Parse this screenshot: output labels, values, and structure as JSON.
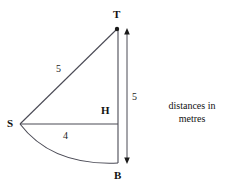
{
  "figure": {
    "type": "geometry-diagram",
    "caption_line1": "distances in",
    "caption_line2": "metres",
    "vertices": {
      "T": "T",
      "S": "S",
      "H": "H",
      "B": "B"
    },
    "measurements": {
      "slant_ST": "5",
      "horizontal_SH": "4",
      "vertical_TB": "5"
    },
    "colors": {
      "stroke": "#4a4a55",
      "text": "#111111",
      "background": "#ffffff"
    }
  }
}
